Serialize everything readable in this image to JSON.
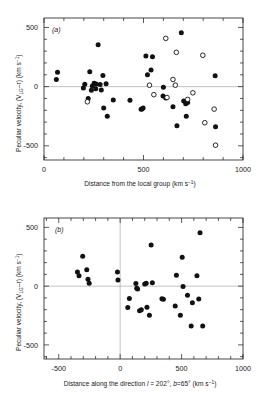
{
  "figure": {
    "background_color": "#ffffff",
    "ink_color": "#1a1a1a",
    "zeroline_color": "#9a9a9a"
  },
  "chart_data": [
    {
      "panel": "a",
      "tag": "(a)",
      "type": "scatter",
      "title": "",
      "xlabel": "Distance from the local group (km s⁻¹)",
      "ylabel": "Peculiar velocity, (Vₗₘ–r) (km s⁻¹)",
      "ylabel_parts": {
        "lead": "Peculiar velocity, (V",
        "sub": "LG",
        "mid": "–r) (km s",
        "sup": "−1",
        "tail": ")"
      },
      "xlabel_parts": {
        "lead": "Distance from the local group (km s",
        "sup": "−1",
        "tail": ")"
      },
      "xlim": [
        0,
        1000
      ],
      "ylim": [
        -620,
        580
      ],
      "xticks": [
        0,
        500,
        1000
      ],
      "xtick_labels": [
        "0",
        "500",
        "1000"
      ],
      "xminor_step": 100,
      "yticks": [
        -500,
        0,
        500
      ],
      "ytick_labels": [
        "-500",
        "0",
        "500"
      ],
      "yminor_step": 100,
      "grid": false,
      "zeroline_y": 0,
      "legend": [],
      "series": [
        {
          "name": "filled-circles",
          "marker": "filled",
          "points": [
            [
              62,
              60
            ],
            [
              68,
              122
            ],
            [
              198,
              -12
            ],
            [
              205,
              20
            ],
            [
              222,
              -100
            ],
            [
              230,
              125
            ],
            [
              238,
              -30
            ],
            [
              243,
              5
            ],
            [
              252,
              28
            ],
            [
              260,
              -18
            ],
            [
              262,
              22
            ],
            [
              272,
              355
            ],
            [
              282,
              18
            ],
            [
              288,
              -28
            ],
            [
              296,
              95
            ],
            [
              300,
              -180
            ],
            [
              312,
              25
            ],
            [
              318,
              -250
            ],
            [
              348,
              -112
            ],
            [
              432,
              -115
            ],
            [
              488,
              -192
            ],
            [
              492,
              -188
            ],
            [
              498,
              -180
            ],
            [
              512,
              258
            ],
            [
              520,
              100
            ],
            [
              538,
              140
            ],
            [
              545,
              252
            ],
            [
              598,
              -80
            ],
            [
              600,
              -5
            ],
            [
              612,
              -95
            ],
            [
              648,
              -170
            ],
            [
              668,
              -330
            ],
            [
              690,
              455
            ],
            [
              702,
              -122
            ],
            [
              712,
              -145
            ],
            [
              715,
              -250
            ],
            [
              722,
              -135
            ],
            [
              860,
              92
            ],
            [
              862,
              -340
            ]
          ]
        },
        {
          "name": "open-circles",
          "marker": "open",
          "points": [
            [
              218,
              -128
            ],
            [
              530,
              12
            ],
            [
              552,
              -68
            ],
            [
              612,
              408
            ],
            [
              618,
              -92
            ],
            [
              648,
              60
            ],
            [
              660,
              12
            ],
            [
              665,
              290
            ],
            [
              722,
              -108
            ],
            [
              748,
              -52
            ],
            [
              798,
              265
            ],
            [
              808,
              -305
            ],
            [
              855,
              -190
            ],
            [
              862,
              -495
            ]
          ]
        }
      ]
    },
    {
      "panel": "b",
      "tag": "(b)",
      "type": "scatter",
      "title": "",
      "xlabel": "Distance along the direction l = 202°, b = 65° (km s⁻¹)",
      "ylabel": "Peculiar velocity, (Vₗₘ–r) (km s⁻¹)",
      "ylabel_parts": {
        "lead": "Peculiar velocity, (V",
        "sub": "LG",
        "mid": "–r) (km s",
        "sup": "−1",
        "tail": ")"
      },
      "xlabel_parts": {
        "lead": "Distance along the direction ",
        "ital1": "l",
        "mid1": " = 202°, ",
        "ital2": "b",
        "mid2": "=65° (km s",
        "sup": "−1",
        "tail": ")"
      },
      "xlim": [
        -620,
        1000
      ],
      "ylim": [
        -620,
        580
      ],
      "xticks": [
        -500,
        0,
        500,
        1000
      ],
      "xtick_labels": [
        "-500",
        "0",
        "500",
        "1000"
      ],
      "xminor_step": 100,
      "yticks": [
        -500,
        0,
        500
      ],
      "ytick_labels": [
        "-500",
        "0",
        "500"
      ],
      "yminor_step": 100,
      "grid": false,
      "zeroline_y": 0,
      "zeroline_x": 0,
      "legend": [],
      "series": [
        {
          "name": "filled-circles",
          "marker": "filled",
          "points": [
            [
              -348,
              120
            ],
            [
              -335,
              88
            ],
            [
              -305,
              255
            ],
            [
              -272,
              140
            ],
            [
              -262,
              58
            ],
            [
              -252,
              25
            ],
            [
              -22,
              120
            ],
            [
              -18,
              52
            ],
            [
              62,
              -182
            ],
            [
              75,
              -105
            ],
            [
              128,
              22
            ],
            [
              135,
              -18
            ],
            [
              142,
              -25
            ],
            [
              158,
              -210
            ],
            [
              172,
              -200
            ],
            [
              200,
              18
            ],
            [
              212,
              25
            ],
            [
              218,
              -180
            ],
            [
              238,
              -248
            ],
            [
              252,
              350
            ],
            [
              262,
              28
            ],
            [
              340,
              -108
            ],
            [
              352,
              -112
            ],
            [
              448,
              -168
            ],
            [
              458,
              92
            ],
            [
              490,
              -248
            ],
            [
              505,
              245
            ],
            [
              512,
              -2
            ],
            [
              548,
              -78
            ],
            [
              578,
              -340
            ],
            [
              588,
              -142
            ],
            [
              625,
              88
            ],
            [
              640,
              -110
            ],
            [
              650,
              455
            ],
            [
              672,
              -340
            ]
          ]
        }
      ]
    }
  ]
}
